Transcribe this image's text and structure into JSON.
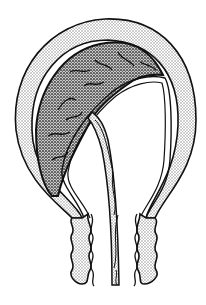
{
  "figure": {
    "labels": [],
    "colors": {
      "background": "#ffffff",
      "outline": "#111111",
      "wall_stipple": "#bdbdbd",
      "placenta_stipple": "#444444"
    },
    "parts": [
      {
        "id": "uterine-wall",
        "fill": "light-stipple"
      },
      {
        "id": "placenta",
        "fill": "dense-stipple"
      },
      {
        "id": "amniotic-membrane",
        "fill": "none"
      },
      {
        "id": "umbilical-cord",
        "fill": "light-stipple",
        "style": "twisted"
      },
      {
        "id": "cervix-left",
        "fill": "light-stipple",
        "style": "wavy"
      },
      {
        "id": "cervix-right",
        "fill": "light-stipple",
        "style": "wavy"
      }
    ]
  }
}
